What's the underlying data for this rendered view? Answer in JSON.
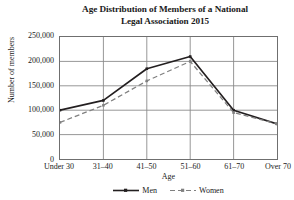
{
  "chart_data": {
    "type": "line",
    "title": "Age Distribution of Members of a National Legal Association 2015",
    "title_lines": [
      "Age Distribution of Members of a National",
      "Legal Association 2015"
    ],
    "xlabel": "Age",
    "ylabel": "Number of members",
    "categories": [
      "Under 30",
      "31–40",
      "41–50",
      "51–60",
      "61–70",
      "Over 70"
    ],
    "ylim": [
      0,
      250000
    ],
    "yticks": [
      0,
      50000,
      100000,
      150000,
      200000,
      250000
    ],
    "ytick_labels": [
      "0",
      "50,000",
      "100,000",
      "150,000",
      "200,000",
      "250,000"
    ],
    "grid": true,
    "legend_position": "bottom",
    "series": [
      {
        "name": "Men",
        "style": "solid",
        "color": "#231f20",
        "marker": "square",
        "values": [
          100000,
          120000,
          185000,
          210000,
          100000,
          72000
        ]
      },
      {
        "name": "Women",
        "style": "dashed",
        "color": "#808080",
        "marker": "square",
        "values": [
          75000,
          110000,
          160000,
          200000,
          95000,
          72000
        ]
      }
    ]
  },
  "colors": {
    "men": "#231f20",
    "women": "#808080",
    "frame": "#6f6f6f",
    "grid": "#8a8a8a",
    "background": "#ffffff"
  }
}
